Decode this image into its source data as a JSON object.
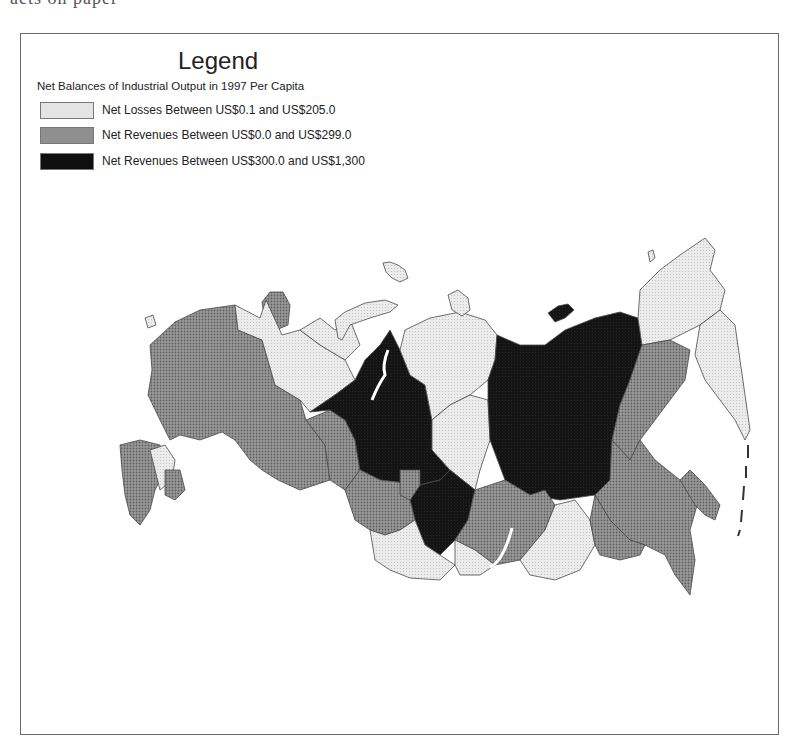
{
  "page": {
    "top_clipped_text": "acts on paper"
  },
  "legend": {
    "title": "Legend",
    "subtitle": "Net Balances of Industrial Output in 1997 Per Capita",
    "items": [
      {
        "label": "Net Losses Between US$0.1 and US$205.0",
        "category": "loss",
        "color": "#e4e4e4"
      },
      {
        "label": "Net Revenues Between US$0.0 and US$299.0",
        "category": "mid",
        "color": "#8f8f8f"
      },
      {
        "label": "Net Revenues Between US$300.0 and US$1,300",
        "category": "high",
        "color": "#0f0f0f"
      }
    ]
  },
  "colors": {
    "loss": "#e4e4e4",
    "mid": "#8f8f8f",
    "high": "#0f0f0f",
    "border": "#4a4a4a",
    "frame": "#6a6a6a"
  },
  "map": {
    "subject": "Russian Federation regions",
    "regions": [
      {
        "name": "European Russia (west/central)",
        "category": "mid",
        "points": "150,345 175,322 200,310 235,305 238,330 262,340 275,385 300,400 306,420 325,445 330,480 300,490 278,480 262,470 250,460 235,440 222,432 200,440 180,435 170,440 160,420 148,395 152,370"
      },
      {
        "name": "Kola Peninsula",
        "category": "mid",
        "points": "262,302 270,292 283,292 290,305 288,325 276,330 265,322"
      },
      {
        "name": "Karelia / Arkhangelsk",
        "category": "loss",
        "points": "235,305 260,318 266,300 282,335 300,330 320,345 345,360 355,380 335,395 310,412 300,400 275,385 262,340 238,330"
      },
      {
        "name": "Komi",
        "category": "loss",
        "points": "300,330 320,318 335,330 350,320 360,345 345,360 320,345"
      },
      {
        "name": "Urals south",
        "category": "mid",
        "points": "306,420 330,410 345,420 355,440 360,470 345,490 330,480 325,445"
      },
      {
        "name": "Tyumen / Yamal",
        "category": "high",
        "points": "310,412 335,395 355,380 365,360 380,345 390,330 400,350 410,375 425,385 432,420 432,450 450,470 440,480 420,485 380,480 360,470 355,440 345,420 330,410"
      },
      {
        "name": "Taimyr / Krasnoyarsk north",
        "category": "loss",
        "points": "405,330 430,318 460,312 485,320 497,335 495,360 488,380 470,395 450,405 432,420 425,385 410,375 400,350"
      },
      {
        "name": "Evenkia",
        "category": "loss",
        "points": "450,405 470,395 488,400 490,440 480,470 475,490 450,470 432,450 432,420"
      },
      {
        "name": "Krasnoyarsk south",
        "category": "high",
        "points": "420,485 440,480 450,470 475,490 468,520 455,540 440,555 425,545 415,520 410,500"
      },
      {
        "name": "Sakha (Yakutia)",
        "category": "high",
        "points": "488,380 495,360 497,335 520,345 545,345 565,330 595,318 620,312 638,318 642,345 630,380 620,405 612,440 610,480 595,495 560,500 530,495 505,480 490,440 488,400"
      },
      {
        "name": "Chukotka / Magadan north",
        "category": "loss",
        "points": "638,318 640,290 660,270 680,255 705,238 715,250 710,270 725,290 720,310 700,325 670,340 642,345"
      },
      {
        "name": "Magadan",
        "category": "mid",
        "points": "642,345 670,340 690,350 685,380 670,400 655,420 640,440 630,460 612,440 620,405 630,380"
      },
      {
        "name": "Kamchatka",
        "category": "loss",
        "points": "700,325 720,310 735,325 740,360 745,395 750,430 745,440 735,420 720,400 705,380 695,355"
      },
      {
        "name": "Khabarovsk / Far East south",
        "category": "mid",
        "points": "612,440 630,460 640,440 655,460 680,480 700,495 690,530 695,560 690,595 675,575 665,555 645,545 630,540 610,520 595,495 610,480"
      },
      {
        "name": "Sakhalin",
        "category": "mid",
        "points": "680,480 690,470 705,485 720,505 715,520 705,515 695,505"
      },
      {
        "name": "Irkutsk / Buryatia",
        "category": "mid",
        "points": "468,520 475,490 505,480 530,495 545,490 555,505 545,530 520,560 495,565 475,550 455,540"
      },
      {
        "name": "Chita",
        "category": "loss",
        "points": "545,530 555,505 575,500 590,520 595,545 580,570 555,580 530,575 520,560"
      },
      {
        "name": "Amur / Jewish AO",
        "category": "mid",
        "points": "595,495 610,520 630,540 645,545 640,555 620,560 600,555 595,545 590,520"
      },
      {
        "name": "Western Siberia south (Omsk/Novosibirsk)",
        "category": "mid",
        "points": "345,490 360,470 380,480 420,485 410,500 415,520 400,530 385,535 370,530 355,520"
      },
      {
        "name": "Tomsk",
        "category": "mid",
        "points": "400,470 420,470 420,485 410,500 400,495"
      },
      {
        "name": "Altai",
        "category": "loss",
        "points": "370,530 385,535 400,530 415,520 425,545 440,555 455,565 440,580 410,578 390,570 375,560"
      },
      {
        "name": "Tuva",
        "category": "loss",
        "points": "455,540 475,550 495,565 480,575 460,575 455,565"
      },
      {
        "name": "Kaliningrad",
        "category": "loss",
        "points": "145,318 153,315 156,325 148,328"
      },
      {
        "name": "North Caucasus west",
        "category": "mid",
        "points": "120,445 140,440 160,445 165,470 155,490 150,510 140,525 130,515 125,495 122,470"
      },
      {
        "name": "North Caucasus light",
        "category": "loss",
        "points": "150,450 165,445 175,460 172,480 160,490 155,470"
      },
      {
        "name": "Dagestan",
        "category": "mid",
        "points": "165,470 180,470 185,490 175,500 165,495"
      }
    ],
    "islands": [
      {
        "name": "Novaya Zemlya",
        "category": "loss",
        "points": "335,320 345,312 365,303 385,300 398,305 390,312 370,318 350,325 342,340 338,338"
      },
      {
        "name": "Franz Josef Land",
        "category": "loss",
        "points": "383,263 390,262 398,265 405,270 408,278 400,282 392,278 386,272"
      },
      {
        "name": "Severnaya Zemlya",
        "category": "loss",
        "points": "448,295 458,290 468,298 470,310 462,316 452,310"
      },
      {
        "name": "New Siberian Islands",
        "category": "high",
        "points": "548,313 558,306 568,304 574,310 565,318 555,322"
      },
      {
        "name": "Wrangel Island",
        "category": "loss",
        "points": "648,252 653,250 655,258 650,262"
      }
    ]
  }
}
